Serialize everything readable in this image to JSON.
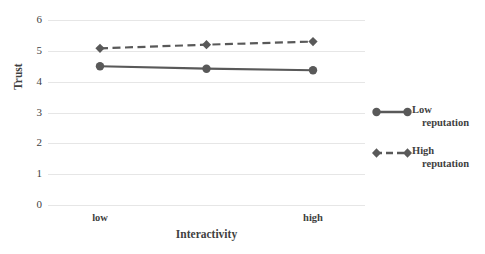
{
  "chart_data": {
    "type": "line",
    "title": "",
    "xlabel": "Interactivity",
    "ylabel": "Trust",
    "categories": [
      "low",
      "",
      "high"
    ],
    "xtick_labels": [
      "low",
      "high"
    ],
    "ylim": [
      0,
      6
    ],
    "ytick_labels": [
      "6",
      "5",
      "4",
      "3",
      "2",
      "1",
      "0"
    ],
    "yticks": [
      6,
      5,
      4,
      3,
      2,
      1,
      0
    ],
    "grid": true,
    "legend_position": "right",
    "series": [
      {
        "name": "Low reputation",
        "label_line1": "Low",
        "label_line2": "reputation",
        "style": "solid",
        "marker": "circle",
        "color": "#595959",
        "values": [
          4.5,
          4.42,
          4.37
        ]
      },
      {
        "name": "High reputation",
        "label_line1": "High",
        "label_line2": "reputation",
        "style": "dashed",
        "marker": "diamond",
        "color": "#595959",
        "values": [
          5.08,
          5.2,
          5.3
        ]
      }
    ]
  },
  "colors": {
    "series": "#595959",
    "gridline": "#e6e6e6",
    "text": "#3f3f3f",
    "background": "#ffffff"
  }
}
